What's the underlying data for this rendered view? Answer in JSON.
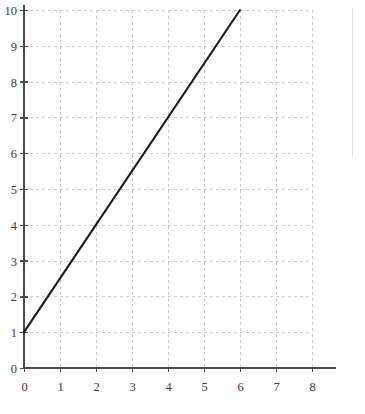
{
  "chart_data": {
    "type": "line",
    "title": "",
    "subtitle": "",
    "xlabel": "",
    "ylabel": "",
    "xlim": [
      0,
      8
    ],
    "ylim": [
      0,
      10
    ],
    "grid": true,
    "legend": null,
    "legend_position": "none",
    "x_ticks": [
      "0",
      "1",
      "2",
      "3",
      "4",
      "5",
      "6",
      "7",
      "8"
    ],
    "y_ticks": [
      "0",
      "1",
      "2",
      "3",
      "4",
      "5",
      "6",
      "7",
      "8",
      "9",
      "10"
    ],
    "x_tick_values": [
      0,
      1,
      2,
      3,
      4,
      5,
      6,
      7,
      8
    ],
    "y_tick_values": [
      0,
      1,
      2,
      3,
      4,
      5,
      6,
      7,
      8,
      9,
      10
    ],
    "series": [
      {
        "name": "line",
        "x": [
          0,
          6
        ],
        "values": [
          1,
          10
        ],
        "color": "#1a1a1a",
        "slope": 1.5,
        "intercept": 1
      }
    ],
    "annotations": [],
    "colors": {
      "line": "#1a1a1a",
      "grid": "#c9c9c9",
      "axis": "#4a4a4a",
      "label": "#3a3a3a",
      "background": "#ffffff"
    }
  },
  "geometry": {
    "plot_left": 24,
    "plot_right": 312,
    "plot_top": 10,
    "plot_bottom": 368,
    "x_unit_px": 36,
    "y_unit_px": 35.8,
    "x_label_y": 391,
    "y_label_x": 17
  }
}
